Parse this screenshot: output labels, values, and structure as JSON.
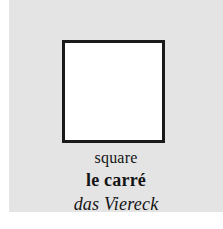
{
  "card": {
    "background_color": "#e4e4e4",
    "page_background_color": "#ffffff"
  },
  "figure": {
    "icon_name": "square-outline-icon",
    "shape": "square",
    "fill_color": "#ffffff",
    "stroke_color": "#1a1a1a"
  },
  "labels": {
    "english": "square",
    "french": "le carré",
    "german": "das Viereck"
  }
}
